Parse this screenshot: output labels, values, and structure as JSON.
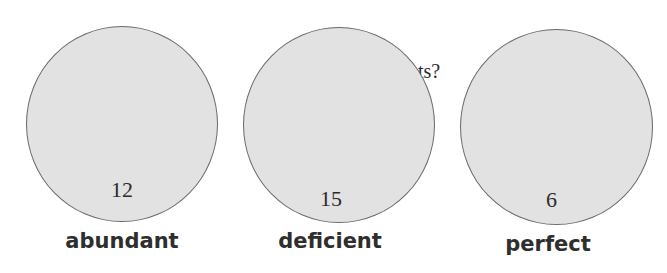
{
  "background_text": "ts?",
  "circles": [
    {
      "label": "abundant",
      "count": "12"
    },
    {
      "label": "deficient",
      "count": "15"
    },
    {
      "label": "perfect",
      "count": "6"
    }
  ],
  "colors": {
    "circle_fill": "#e2e2e2",
    "circle_stroke": "#6a6a6a",
    "text": "#2e2e2e"
  }
}
